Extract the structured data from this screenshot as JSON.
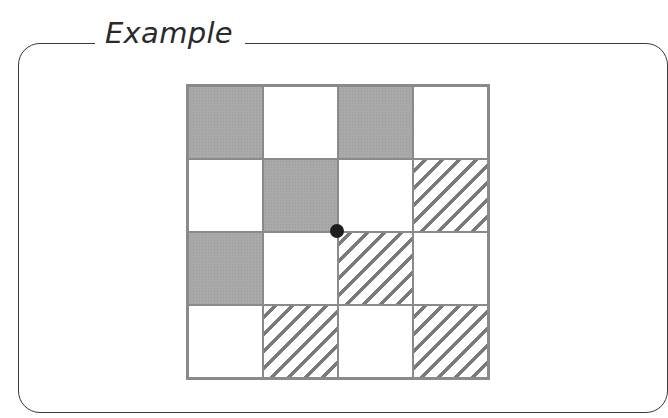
{
  "title": "Example",
  "grid": {
    "rows": 4,
    "cols": 4,
    "cells": [
      [
        "gray",
        "white",
        "gray",
        "white"
      ],
      [
        "white",
        "gray",
        "white",
        "hatched"
      ],
      [
        "gray",
        "white",
        "hatched",
        "white"
      ],
      [
        "white",
        "hatched",
        "white",
        "hatched"
      ]
    ],
    "legend": {
      "gray": "shaded cell",
      "hatched": "diagonal-striped cell",
      "white": "empty cell"
    }
  },
  "point": {
    "row_line": 2,
    "col_line": 2,
    "description": "black dot at center grid intersection"
  },
  "colors": {
    "frame": "#3a3a3a",
    "grid_line": "#8a8a8a",
    "gray_fill": "#a9a9a9",
    "hatch": "#7a7a7a",
    "dot": "#1e1e1e"
  }
}
